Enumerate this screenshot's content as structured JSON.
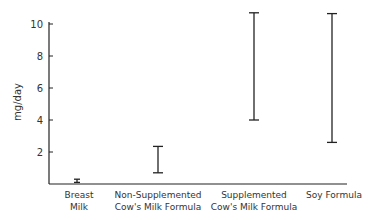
{
  "chart_data": {
    "type": "range",
    "title": "",
    "xlabel": "",
    "ylabel": "mg/day",
    "ylim": [
      0,
      10
    ],
    "yticks": [
      2,
      4,
      6,
      8,
      10
    ],
    "grid": false,
    "legend": null,
    "categories": [
      [
        "Breast",
        "Milk"
      ],
      [
        "Non-Supplemented",
        "Cow's Milk Formula"
      ],
      [
        "Supplemented",
        "Cow's Milk Formula"
      ],
      [
        "Soy Formula"
      ]
    ],
    "series": [
      {
        "name": "range",
        "ranges": [
          {
            "low": 0.1,
            "high": 0.3
          },
          {
            "low": 0.7,
            "high": 2.35
          },
          {
            "low": 4.0,
            "high": 10.7
          },
          {
            "low": 2.6,
            "high": 10.65
          }
        ]
      }
    ]
  },
  "colors": {
    "ink": "#222222",
    "background": "#ffffff"
  }
}
